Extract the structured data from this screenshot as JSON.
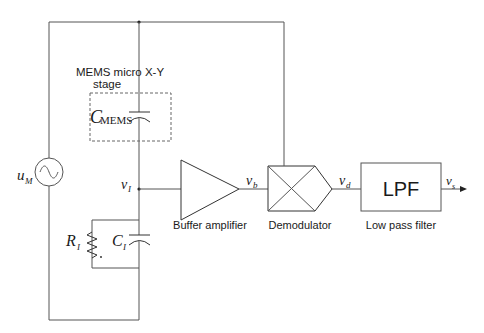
{
  "diagram": {
    "type": "circuit-block-diagram",
    "labels": {
      "mems_stage_line1": "MEMS micro X-Y",
      "mems_stage_line2": "stage",
      "c_mems_main": "C",
      "c_mems_sub": "MEMS",
      "source": "u",
      "source_sub": "M",
      "v_i": "v",
      "v_i_sub": "I",
      "v_b": "v",
      "v_b_sub": "b",
      "v_d": "v",
      "v_d_sub": "d",
      "v_s": "v",
      "v_s_sub": "s",
      "r_i": "R",
      "r_i_sub": "I",
      "c_i": "C",
      "c_i_sub": "I"
    },
    "blocks": {
      "buffer_amplifier": "Buffer amplifier",
      "demodulator": "Demodulator",
      "lpf": "LPF",
      "low_pass_filter": "Low pass filter"
    },
    "colors": {
      "wire": "#555555",
      "text": "#1a1a1a",
      "background": "#ffffff"
    }
  }
}
